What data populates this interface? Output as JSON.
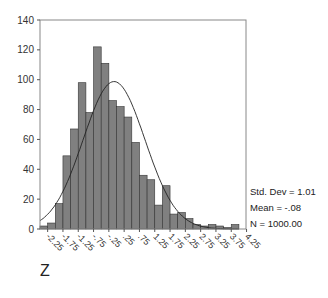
{
  "chart_data": {
    "type": "bar",
    "subtype": "histogram_with_normal_curve",
    "title": "",
    "xlabel": "Z",
    "ylabel": "",
    "ylim": [
      0,
      140
    ],
    "yticks": [
      0,
      20,
      40,
      60,
      80,
      100,
      120,
      140
    ],
    "xticks": [
      "-2.25",
      "-1.75",
      "-1.25",
      "-.75",
      "-.25",
      ".25",
      ".75",
      "1.25",
      "1.75",
      "2.25",
      "2.75",
      "3.25",
      "3.75",
      "4.25"
    ],
    "bin_width": 0.25,
    "bin_start": -2.5,
    "values": [
      2,
      4,
      17,
      49,
      67,
      98,
      78,
      122,
      111,
      86,
      82,
      75,
      58,
      36,
      33,
      16,
      29,
      10,
      11,
      7,
      3,
      2,
      3,
      2,
      1,
      3
    ],
    "grid": false,
    "legend": "none",
    "bar_color": "#808080",
    "curve": {
      "type": "normal",
      "mean": -0.08,
      "std": 1.01,
      "n": 1000,
      "color": "#222222"
    },
    "stats": {
      "std_dev": "Std. Dev = 1.01",
      "mean": "Mean = -.08",
      "n": "N = 1000.00"
    }
  }
}
